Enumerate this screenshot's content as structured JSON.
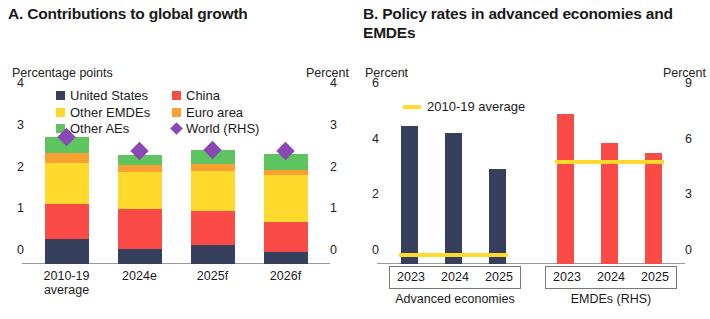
{
  "panel_a": {
    "title": "A. Contributions to global growth",
    "unit_left": "Percentage points",
    "unit_right": "Percent",
    "legend": [
      {
        "label": "United States",
        "color": "#36405c",
        "marker": "square"
      },
      {
        "label": "China",
        "color": "#fb4b46",
        "marker": "square"
      },
      {
        "label": "Other EMDEs",
        "color": "#ffd92b",
        "marker": "square"
      },
      {
        "label": "Euro area",
        "color": "#f9a033",
        "marker": "square"
      },
      {
        "label": "Other AEs",
        "color": "#5dc45f",
        "marker": "square"
      },
      {
        "label": "World (RHS)",
        "color": "#8a48b5",
        "marker": "diamond"
      }
    ],
    "ticks_left": [
      "4",
      "3",
      "2",
      "1",
      "0"
    ],
    "ticks_right": [
      "4",
      "3",
      "2",
      "1",
      "0"
    ]
  },
  "panel_b": {
    "title": "B. Policy rates in advanced economies and EMDEs",
    "unit_left": "Percent",
    "unit_right": "Percent",
    "legend": [
      {
        "label": "2010-19 average",
        "color": "#ffd92b",
        "marker": "line"
      }
    ],
    "ticks_left": [
      "6",
      "4",
      "2",
      "0"
    ],
    "ticks_right": [
      "9",
      "6",
      "3",
      "0"
    ],
    "group_labels": [
      "Advanced economies",
      "EMDEs (RHS)"
    ]
  },
  "chart_data": [
    {
      "type": "bar",
      "title": "A. Contributions to global growth",
      "stacked": true,
      "xlabel": "",
      "ylabel": "Percentage points",
      "ylabel_right": "Percent",
      "ylim": [
        0,
        4
      ],
      "ylim_right": [
        0,
        4
      ],
      "categories": [
        "2010-19 average",
        "2024e",
        "2025f",
        "2026f"
      ],
      "series": [
        {
          "name": "United States",
          "color": "#36405c",
          "values": [
            0.59,
            0.36,
            0.45,
            0.29
          ]
        },
        {
          "name": "China",
          "color": "#fb4b46",
          "values": [
            0.85,
            0.95,
            0.81,
            0.72
          ]
        },
        {
          "name": "Other EMDEs",
          "color": "#ffd92b",
          "values": [
            0.97,
            0.9,
            0.97,
            1.12
          ]
        },
        {
          "name": "Euro area",
          "color": "#f9a033",
          "values": [
            0.26,
            0.16,
            0.16,
            0.13
          ]
        },
        {
          "name": "Other AEs",
          "color": "#5dc45f",
          "values": [
            0.38,
            0.25,
            0.34,
            0.37
          ]
        }
      ],
      "overlay": {
        "name": "World (RHS)",
        "color": "#8a48b5",
        "marker": "diamond",
        "axis": "right",
        "values": [
          3.05,
          2.7,
          2.72,
          2.7
        ]
      },
      "legend_position": "top",
      "grid": false
    },
    {
      "type": "bar",
      "title": "B. Policy rates in advanced economies and EMDEs",
      "xlabel": "",
      "ylabel": "Percent",
      "ylabel_right": "Percent",
      "ylim": [
        0,
        6
      ],
      "ylim_right": [
        0,
        9
      ],
      "groups": [
        {
          "name": "Advanced economies",
          "axis": "left",
          "color": "#36405c",
          "categories": [
            "2023",
            "2024",
            "2025"
          ],
          "values": [
            4.95,
            4.7,
            3.4
          ],
          "average_line": {
            "label": "2010-19 average",
            "value": 0.25,
            "color": "#ffd92b"
          }
        },
        {
          "name": "EMDEs (RHS)",
          "axis": "right",
          "color": "#fb4b46",
          "categories": [
            "2023",
            "2024",
            "2025"
          ],
          "values": [
            8.1,
            6.5,
            6.0
          ],
          "average_line": {
            "label": "2010-19 average",
            "value": 5.4,
            "color": "#ffd92b"
          }
        }
      ],
      "legend_position": "top-left",
      "grid": false
    }
  ]
}
